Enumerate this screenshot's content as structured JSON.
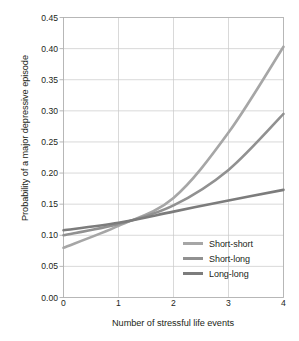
{
  "chart_data": {
    "type": "line",
    "title": "",
    "xlabel": "Number of stressful life events",
    "ylabel": "Probability of a major depressive episode",
    "x": [
      0,
      1,
      2,
      3,
      4
    ],
    "xlim": [
      0,
      4
    ],
    "ylim": [
      0.0,
      0.45
    ],
    "xticks": [
      "0",
      "1",
      "2",
      "3",
      "4"
    ],
    "yticks": [
      "0.00",
      "0.05",
      "0.10",
      "0.15",
      "0.20",
      "0.25",
      "0.30",
      "0.35",
      "0.40",
      "0.45"
    ],
    "ytick_values": [
      0.0,
      0.05,
      0.1,
      0.15,
      0.2,
      0.25,
      0.3,
      0.35,
      0.4,
      0.45
    ],
    "grid": true,
    "grid_color": "#c9c9c9",
    "frame_color": "#b0b0b0",
    "legend_position": "lower-right-inside",
    "series": [
      {
        "name": "Short-short",
        "values": [
          0.08,
          0.115,
          0.16,
          0.265,
          0.403
        ],
        "color": "#a6a6a6"
      },
      {
        "name": "Short-long",
        "values": [
          0.1,
          0.118,
          0.148,
          0.205,
          0.295
        ],
        "color": "#919191"
      },
      {
        "name": "Long-long",
        "values": [
          0.108,
          0.12,
          0.138,
          0.156,
          0.173
        ],
        "color": "#7c7c7c"
      }
    ]
  },
  "legend": {
    "items": [
      {
        "label": "Short-short"
      },
      {
        "label": "Short-long"
      },
      {
        "label": "Long-long"
      }
    ]
  }
}
